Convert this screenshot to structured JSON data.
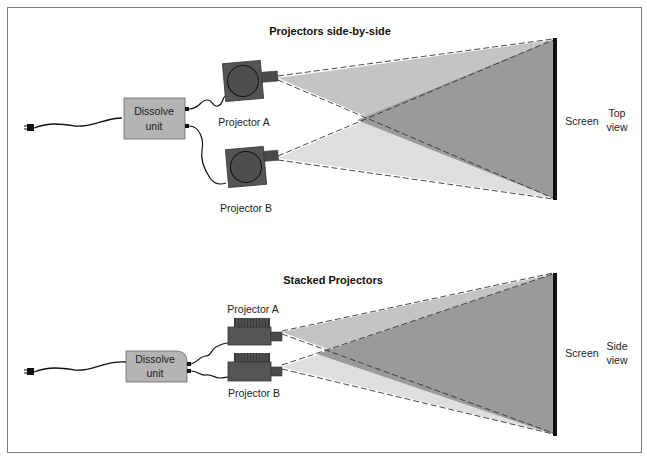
{
  "top_section": {
    "title": "Projectors side-by-side",
    "dissolve_unit": {
      "line1": "Dissolve",
      "line2": "unit"
    },
    "projector_a": "Projector A",
    "projector_b": "Projector B",
    "screen_label": "Screen",
    "view_label": {
      "line1": "Top",
      "line2": "view"
    }
  },
  "bottom_section": {
    "title": "Stacked Projectors",
    "dissolve_unit": {
      "line1": "Dissolve",
      "line2": "unit"
    },
    "projector_a": "Projector A",
    "projector_b": "Projector B",
    "screen_label": "Screen",
    "view_label": {
      "line1": "Side",
      "line2": "view"
    }
  },
  "colors": {
    "frame": "#7a7a7a",
    "dissolve_fill": "#b4b4b4",
    "projector_fill": "#555555",
    "beam_a": "#c4c4c4",
    "beam_b": "#dedede",
    "beam_overlap": "#9a9a9a",
    "screen": "#111111"
  }
}
